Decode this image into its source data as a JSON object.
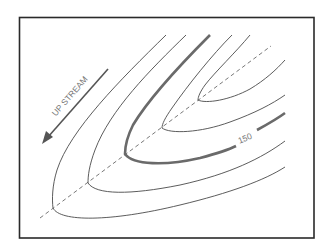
{
  "diagram": {
    "title": "",
    "type": "contour-map-valley",
    "direction_label": "UP STREAM",
    "contour_label": "150",
    "colors": {
      "frame": "#2a2a2a",
      "contour": "#4a4a4a",
      "index_contour": "#6a6a6a",
      "thalweg": "#555555",
      "label": "#777777"
    },
    "elements": [
      {
        "name": "frame",
        "kind": "rectangle"
      },
      {
        "name": "thalweg",
        "kind": "dashed-line",
        "description": "stream axis through contour vertices"
      },
      {
        "name": "contour-1",
        "kind": "V-shaped contour line"
      },
      {
        "name": "contour-2",
        "kind": "V-shaped contour line"
      },
      {
        "name": "contour-3",
        "kind": "index contour (thick)",
        "label": "150"
      },
      {
        "name": "contour-4",
        "kind": "V-shaped contour line"
      },
      {
        "name": "contour-5",
        "kind": "V-shaped contour line"
      },
      {
        "name": "upstream-arrow",
        "kind": "arrow",
        "label": "UP STREAM"
      }
    ]
  }
}
